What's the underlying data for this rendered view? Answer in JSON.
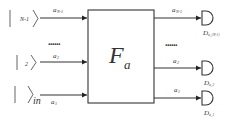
{
  "diagram": {
    "box_label": {
      "main": "F",
      "sub": "a"
    },
    "inputs": [
      {
        "ket": "N-1",
        "wire_label": {
          "main": "a",
          "sub": "N-1"
        }
      },
      {
        "ket": "2",
        "wire_label": {
          "main": "a",
          "sub": "2"
        }
      },
      {
        "ket": "in",
        "wire_label": {
          "main": "a",
          "sub": "1"
        }
      }
    ],
    "outputs": [
      {
        "wire_label": {
          "main": "a",
          "sub": "N-1"
        },
        "detector": {
          "main": "D",
          "sub": "a_{N-1}"
        }
      },
      {
        "wire_label": {
          "main": "a",
          "sub": "2"
        },
        "detector": {
          "main": "D",
          "sub": "a_2"
        }
      },
      {
        "wire_label": {
          "main": "a",
          "sub": "1"
        },
        "detector": {
          "main": "D",
          "sub": "a_1"
        }
      }
    ],
    "ellipsis_left": "......",
    "ellipsis_right": "......"
  }
}
